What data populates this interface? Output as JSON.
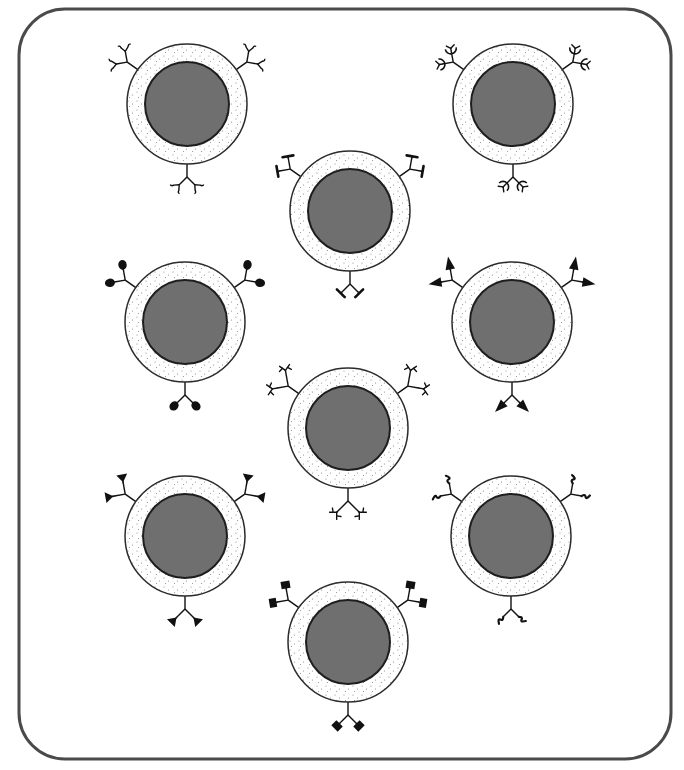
{
  "figure": {
    "width": 684,
    "height": 770,
    "frame": {
      "x": 19,
      "y": 9,
      "width": 652,
      "height": 750,
      "radius": 46,
      "stroke": "#4a4a4a",
      "stroke_width": 3
    },
    "colors": {
      "background": "#ffffff",
      "membrane_fill": "#ffffff",
      "membrane_stroke": "#2b2b2b",
      "stipple": "#8a8a8a",
      "nucleus_fill": "#6f6f6f",
      "nucleus_stroke": "#1e1e1e",
      "receptor": "#111111"
    },
    "cell_geometry": {
      "outer_radius": 60,
      "nucleus_radius": 42
    }
  },
  "cells": [
    {
      "id": "cell-1",
      "cx": 187,
      "cy": 104,
      "receptor": "forked-y",
      "label": "Cell with forked Y-shaped receptors"
    },
    {
      "id": "cell-2",
      "cx": 513,
      "cy": 104,
      "receptor": "hook",
      "label": "Cell with hook/claw receptors"
    },
    {
      "id": "cell-3",
      "cx": 350,
      "cy": 211,
      "receptor": "t-bar",
      "label": "Cell with T-bar receptors"
    },
    {
      "id": "cell-4",
      "cx": 185,
      "cy": 322,
      "receptor": "ball",
      "label": "Cell with ball-tipped receptors"
    },
    {
      "id": "cell-5",
      "cx": 512,
      "cy": 322,
      "receptor": "arrow",
      "label": "Cell with arrow-tipped receptors"
    },
    {
      "id": "cell-6",
      "cx": 348,
      "cy": 428,
      "receptor": "branched",
      "label": "Cell with branched receptors"
    },
    {
      "id": "cell-7",
      "cx": 185,
      "cy": 536,
      "receptor": "triangle",
      "label": "Cell with triangle-tipped receptors"
    },
    {
      "id": "cell-8",
      "cx": 511,
      "cy": 536,
      "receptor": "squiggle",
      "label": "Cell with squiggle-tipped receptors"
    },
    {
      "id": "cell-9",
      "cx": 348,
      "cy": 642,
      "receptor": "square",
      "label": "Cell with square-tipped receptors"
    }
  ],
  "receptor_positions": [
    {
      "name": "upper-left",
      "angle_deg": -145
    },
    {
      "name": "upper-right",
      "angle_deg": -35
    },
    {
      "name": "bottom",
      "angle_deg": 90
    }
  ]
}
